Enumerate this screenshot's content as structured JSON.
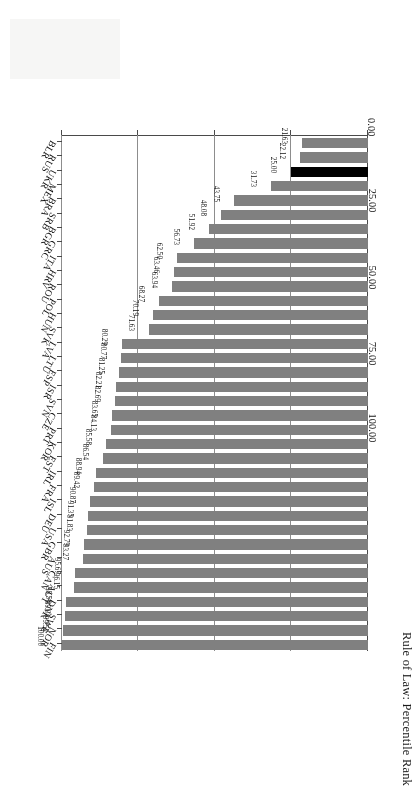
{
  "chart_data": {
    "type": "bar",
    "orientation": "horizontal",
    "title": "",
    "xlabel": "",
    "ylabel": "Rule of Law: Percentile Rank",
    "ylim": [
      0,
      100
    ],
    "tick_labels": [
      "0.00",
      "25.00",
      "50.00",
      "75.00",
      "100.00"
    ],
    "ticks": [
      0,
      25,
      50,
      75,
      100
    ],
    "grid": true,
    "legend": "none",
    "bar_color": "#808080",
    "highlight_color": "#000000",
    "highlight_category": "UKR",
    "categories": [
      "FIN",
      "NOR",
      "SWE",
      "DNK",
      "AUT",
      "CAN",
      "AUS",
      "GBR",
      "USA",
      "DEU",
      "ISL",
      "FRA",
      "IRL",
      "EST",
      "KOR",
      "PRT",
      "CZE",
      "SVN",
      "ISR",
      "ESP",
      "LTU",
      "LVA",
      "SVK",
      "HUN",
      "POL",
      "ROU",
      "HRV",
      "ITA",
      "GRC",
      "BGR",
      "SRB",
      "BRA",
      "MEX",
      "UKR",
      "RUS",
      "BLR"
    ],
    "values": [
      100.0,
      99.52,
      99.04,
      98.56,
      96.15,
      95.67,
      93.27,
      92.79,
      91.83,
      91.35,
      90.87,
      89.42,
      88.94,
      86.54,
      85.58,
      84.13,
      83.65,
      82.69,
      82.21,
      81.25,
      80.77,
      80.29,
      71.63,
      70.19,
      68.27,
      63.94,
      63.46,
      62.5,
      56.73,
      51.92,
      48.08,
      43.75,
      31.73,
      25.0,
      22.12,
      21.63
    ],
    "value_labels": [
      "100.00",
      "99.52",
      "99.04",
      "98.56",
      "96.15",
      "95.67",
      "93.27",
      "92.79",
      "91.83",
      "91.35",
      "90.87",
      "89.42",
      "88.94",
      "86.54",
      "85.58",
      "84.13",
      "83.65",
      "82.69",
      "82.21",
      "81.25",
      "80.77",
      "80.29",
      "71.63",
      "70.19",
      "68.27",
      "63.94",
      "63.46",
      "62.50",
      "56.73",
      "51.92",
      "48.08",
      "43.75",
      "31.73",
      "25.00",
      "22.12",
      "21.63"
    ]
  }
}
